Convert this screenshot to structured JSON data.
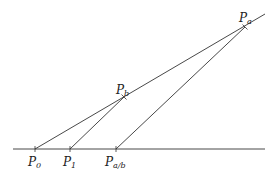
{
  "diagram": {
    "points": [
      {
        "id": "P0",
        "label": "P",
        "sub": "0",
        "x": 35,
        "y": 149
      },
      {
        "id": "P1",
        "label": "P",
        "sub": "1",
        "x": 70,
        "y": 149
      },
      {
        "id": "Pab",
        "label": "P",
        "sub": "a/b",
        "x": 116,
        "y": 149
      },
      {
        "id": "Pb",
        "label": "P",
        "sub": "b",
        "x": 124,
        "y": 97
      },
      {
        "id": "Pa",
        "label": "P",
        "sub": "a",
        "x": 245,
        "y": 27
      }
    ],
    "lines": [
      {
        "id": "baseline",
        "from": [
          13,
          149
        ],
        "to": [
          265,
          149
        ]
      },
      {
        "id": "ray-P0-Pa",
        "from": [
          35,
          149
        ],
        "to": [
          265,
          14
        ]
      },
      {
        "id": "seg-P1-Pb",
        "from": [
          70,
          149
        ],
        "to": [
          124,
          97
        ]
      },
      {
        "id": "seg-Pab-Pa",
        "from": [
          116,
          149
        ],
        "to": [
          245,
          27
        ]
      }
    ],
    "colors": {
      "line": "#333333",
      "text": "#222222",
      "background": "#ffffff"
    }
  }
}
